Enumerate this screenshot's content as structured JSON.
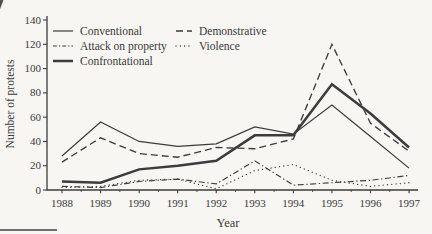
{
  "chart_data": {
    "type": "line",
    "title": "",
    "xlabel": "Year",
    "ylabel": "Number of protests",
    "x": [
      1988,
      1989,
      1990,
      1991,
      1992,
      1993,
      1994,
      1995,
      1996,
      1997
    ],
    "yticks": [
      0,
      20,
      40,
      60,
      80,
      100,
      120,
      140
    ],
    "ylim": [
      0,
      140
    ],
    "grid": false,
    "legend_position": "inside-top-left",
    "legend_columns": [
      [
        "Conventional",
        "Attack on property",
        "Confrontational"
      ],
      [
        "Demonstrative",
        "Violence"
      ]
    ],
    "series": [
      {
        "name": "Demonstrative",
        "style": "dashed",
        "values": [
          23,
          43,
          30,
          27,
          35,
          34,
          42,
          120,
          55,
          32
        ]
      },
      {
        "name": "Violence",
        "style": "dotted",
        "values": [
          2,
          3,
          8,
          9,
          1,
          16,
          21,
          8,
          3,
          6
        ]
      },
      {
        "name": "Attack on property",
        "style": "dash-dot",
        "values": [
          3,
          2,
          7,
          9,
          5,
          24,
          4,
          6,
          8,
          12
        ]
      },
      {
        "name": "Conventional",
        "style": "solid-thin",
        "values": [
          28,
          56,
          40,
          36,
          38,
          52,
          46,
          70,
          44,
          18
        ]
      },
      {
        "name": "Confrontational",
        "style": "solid-thick",
        "values": [
          7,
          6,
          17,
          20,
          24,
          45,
          45,
          87,
          63,
          35
        ]
      }
    ],
    "colors": {
      "line": "#3c3c3c",
      "text": "#3a3a3a",
      "background": "#f7f6f2"
    }
  }
}
